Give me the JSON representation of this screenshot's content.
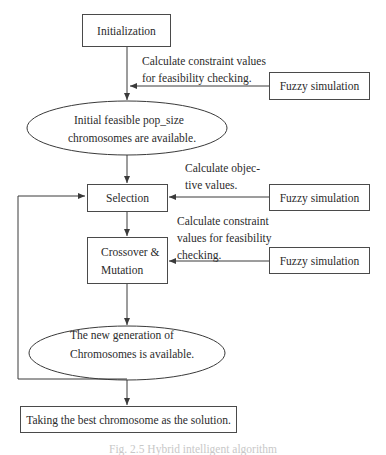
{
  "diagram": {
    "type": "flowchart",
    "nodes": {
      "initialization": {
        "label": "Initialization",
        "shape": "rectangle"
      },
      "initial_population": {
        "line1": "Initial feasible pop_size",
        "line2": "chromosomes are available.",
        "shape": "ellipse"
      },
      "selection": {
        "label": "Selection",
        "shape": "rectangle"
      },
      "crossover_mutation": {
        "line1": "Crossover &",
        "line2": "Mutation",
        "shape": "rectangle"
      },
      "new_generation": {
        "line1": "The new generation of",
        "line2": "Chromosomes is available.",
        "shape": "ellipse"
      },
      "best_solution": {
        "label": "Taking the best chromosome as the solution.",
        "shape": "rectangle"
      },
      "fuzzy_sim_1": {
        "label": "Fuzzy simulation",
        "shape": "rectangle"
      },
      "fuzzy_sim_2": {
        "label": "Fuzzy simulation",
        "shape": "rectangle"
      },
      "fuzzy_sim_3": {
        "label": "Fuzzy simulation",
        "shape": "rectangle"
      }
    },
    "annotations": {
      "constraint_1": {
        "line1": "Calculate constraint values",
        "line2": "for feasibility checking."
      },
      "objective": {
        "line1": "Calculate objec-",
        "line2": "tive values."
      },
      "constraint_2": {
        "line1": "Calculate constraint",
        "line2": "values for feasibility",
        "line3": "checking."
      }
    },
    "edges": [
      {
        "from": "initialization",
        "to": "initial_population"
      },
      {
        "from": "fuzzy_sim_1",
        "to": "initialization-to-initial_population edge",
        "label": "constraint_1"
      },
      {
        "from": "initial_population",
        "to": "selection"
      },
      {
        "from": "fuzzy_sim_2",
        "to": "selection",
        "label": "objective"
      },
      {
        "from": "selection",
        "to": "crossover_mutation"
      },
      {
        "from": "fuzzy_sim_3",
        "to": "crossover_mutation",
        "label": "constraint_2"
      },
      {
        "from": "crossover_mutation",
        "to": "new_generation"
      },
      {
        "from": "new_generation",
        "to": "selection",
        "type": "feedback-loop"
      },
      {
        "from": "new_generation",
        "to": "best_solution"
      }
    ],
    "caption": "Fig. 2.5 Hybrid intelligent algorithm"
  },
  "colors": {
    "line": "#3a3a3a",
    "text": "#2b2b2b",
    "caption": "#c8c8c8"
  }
}
